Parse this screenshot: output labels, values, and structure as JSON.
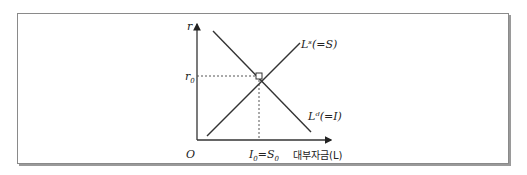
{
  "diagram": {
    "type": "loanable-funds-market",
    "y_axis_label": "r",
    "x_axis_label": "대부자금(L)",
    "origin_label": "O",
    "equilibrium_rate_label": "r0",
    "equilibrium_quantity_label": "I0=S0",
    "supply_curve_label": "Lˢ(=S)",
    "demand_curve_label": "Lᵈ(=I)",
    "colors": {
      "line": "#333333",
      "frame": "#8a8a8a"
    }
  }
}
